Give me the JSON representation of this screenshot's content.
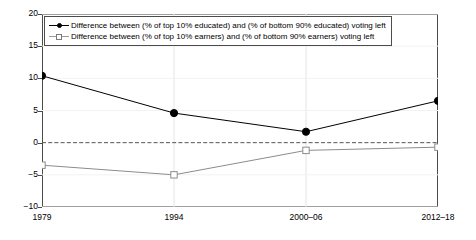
{
  "chart_data": {
    "type": "line",
    "title": "",
    "subtitle": "",
    "xlabel": "",
    "ylabel": "",
    "categories": [
      "1979",
      "1994",
      "2000–06",
      "2012–18"
    ],
    "ylim": [
      -10,
      20
    ],
    "yticks": [
      "20",
      "15",
      "10",
      "5",
      "0",
      "−5",
      "−10"
    ],
    "ytick_values": [
      20,
      15,
      10,
      5,
      0,
      -5,
      -10
    ],
    "grid": "vertical-light",
    "legend_position": "top-left",
    "zero_line": 0,
    "series": [
      {
        "name": "Difference between (% of top 10% educated) and (% of bottom 90% educated) voting left",
        "values": [
          10.4,
          4.6,
          1.7,
          6.5
        ],
        "marker": "filled-circle",
        "color": "#000000"
      },
      {
        "name": "Difference between (% of top 10% earners) and (% of bottom 90% earners) voting left",
        "values": [
          -3.5,
          -5.0,
          -1.2,
          -0.7
        ],
        "marker": "open-square",
        "color": "#8c8c8c"
      }
    ]
  },
  "legend": {
    "items": [
      {
        "label": "Difference between (% of top 10% educated) and (% of bottom 90% educated) voting left",
        "marker": "filled-circle"
      },
      {
        "label": "Difference between (% of top 10% earners) and (% of bottom 90% earners) voting left",
        "marker": "open-square"
      }
    ]
  },
  "colors": {
    "series_educated": "#000000",
    "series_earners": "#8c8c8c",
    "axis": "#4c4c4c",
    "gridline": "#e4e4e4",
    "zero_line": "#555555",
    "background": "#ffffff"
  }
}
